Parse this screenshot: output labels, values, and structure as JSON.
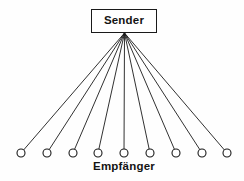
{
  "diagram": {
    "type": "broadcast-fan-diagram",
    "width": 244,
    "height": 181,
    "background_color": "#fefefe",
    "line_color": "#1a1a1a",
    "stroke_color": "#1a1a1a",
    "sender": {
      "label": "Sender",
      "x": 91,
      "y": 9,
      "width": 66,
      "height": 24,
      "border_color": "#1a1a1a",
      "fill_color": "#ffffff",
      "text_color": "#141414"
    },
    "apex": {
      "x": 124.5,
      "y": 33
    },
    "receivers": {
      "label": "Empfänger",
      "count": 9,
      "radius": 4,
      "center_y": 153,
      "fill_color": "#ffffff",
      "stroke_color": "#1a1a1a",
      "nodes": [
        {
          "id": 1,
          "cx": 21,
          "cy": 153
        },
        {
          "id": 2,
          "cx": 47,
          "cy": 153
        },
        {
          "id": 3,
          "cx": 73,
          "cy": 153
        },
        {
          "id": 4,
          "cx": 98,
          "cy": 153
        },
        {
          "id": 5,
          "cx": 124,
          "cy": 153
        },
        {
          "id": 6,
          "cx": 150,
          "cy": 153
        },
        {
          "id": 7,
          "cx": 176,
          "cy": 153
        },
        {
          "id": 8,
          "cx": 202,
          "cy": 153
        },
        {
          "id": 9,
          "cx": 227,
          "cy": 153
        }
      ],
      "label_x": 124,
      "label_y": 161
    }
  }
}
